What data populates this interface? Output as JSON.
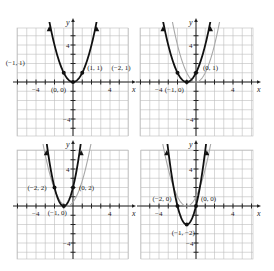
{
  "panels": [
    {
      "id": "top-left",
      "origin_px": [
        73,
        82
      ],
      "grid_px": {
        "x0": 17,
        "x1": 128,
        "y0": 28,
        "y1": 136
      },
      "curves": [
        {
          "role": "primary",
          "equation": "y = x^2",
          "vertex": [
            0,
            0
          ],
          "color": "#111111"
        }
      ],
      "points": [
        {
          "label": "(−1, 1)",
          "x": -1,
          "y": 1,
          "lx": -58,
          "ly": -8
        },
        {
          "label": "(1, 1)",
          "x": 1,
          "y": 1,
          "lx": 5,
          "ly": -3
        },
        {
          "label": "(0, 0)",
          "x": 0,
          "y": 0,
          "lx": -22,
          "ly": 10
        }
      ],
      "ticks_x": [
        "−4",
        "4"
      ],
      "ticks_y": [
        "4",
        "−4"
      ]
    },
    {
      "id": "top-right",
      "origin_px": [
        196,
        82
      ],
      "grid_px": {
        "x0": 140,
        "x1": 253,
        "y0": 28,
        "y1": 136
      },
      "curves": [
        {
          "role": "reference",
          "equation": "y = x^2",
          "vertex": [
            0,
            0
          ],
          "color": "#aaaaaa"
        },
        {
          "role": "primary",
          "equation": "y = (x+1)^2",
          "vertex": [
            -1,
            0
          ],
          "color": "#111111"
        }
      ],
      "points": [
        {
          "label": "(−2, 1)",
          "x": -2,
          "y": 1,
          "lx": -66,
          "ly": -3
        },
        {
          "label": "(0, 1)",
          "x": 0,
          "y": 1,
          "lx": 7,
          "ly": -3
        },
        {
          "label": "(−1, 0)",
          "x": -1,
          "y": 0,
          "lx": -22,
          "ly": 10
        }
      ],
      "ticks_x": [
        "−4",
        "4"
      ],
      "ticks_y": [
        "4",
        "−4"
      ]
    },
    {
      "id": "bottom-left",
      "origin_px": [
        73,
        206
      ],
      "grid_px": {
        "x0": 17,
        "x1": 128,
        "y0": 150,
        "y1": 259
      },
      "curves": [
        {
          "role": "reference",
          "equation": "y = (x+1)^2",
          "vertex": [
            -1,
            0
          ],
          "color": "#aaaaaa",
          "shift_x": 0.35
        },
        {
          "role": "primary",
          "equation": "y = 2(x+1)^2",
          "vertex": [
            -1,
            0
          ],
          "color": "#111111"
        }
      ],
      "points": [
        {
          "label": "(−2, 2)",
          "x": -2,
          "y": 2,
          "lx": -27,
          "ly": 2
        },
        {
          "label": "(0, 2)",
          "x": 0,
          "y": 2,
          "lx": 6,
          "ly": 2
        },
        {
          "label": "(−1, 0)",
          "x": -1,
          "y": 0,
          "lx": -16,
          "ly": 9
        }
      ],
      "ticks_x": [
        "−4",
        "4"
      ],
      "ticks_y": [
        "4",
        "−4"
      ]
    },
    {
      "id": "bottom-right",
      "origin_px": [
        196,
        206
      ],
      "grid_px": {
        "x0": 141,
        "x1": 253,
        "y0": 150,
        "y1": 259
      },
      "curves": [
        {
          "role": "reference",
          "equation": "y = (x+1)^2",
          "vertex": [
            -1,
            0
          ],
          "color": "#aaaaaa"
        },
        {
          "role": "primary",
          "equation": "y = 2(x+1)^2 − 2",
          "vertex": [
            -1,
            -2
          ],
          "color": "#111111"
        }
      ],
      "points": [
        {
          "label": "(−2, 0)",
          "x": -2,
          "y": 0,
          "lx": -25,
          "ly": -5
        },
        {
          "label": "(0, 0)",
          "x": 0,
          "y": 0,
          "lx": 5,
          "ly": -5
        },
        {
          "label": "(−1, −2)",
          "x": -1,
          "y": -2,
          "lx": -15,
          "ly": 10
        }
      ],
      "ticks_x": [
        "−4",
        "4"
      ],
      "ticks_y": [
        "4",
        "−4"
      ]
    }
  ],
  "axis_labels": {
    "x": "x",
    "y": "y"
  },
  "unit_px": 9.25,
  "colors": {
    "grid": "#bdbdbd",
    "axis": "#222222",
    "primary": "#111111",
    "reference": "#a8a8a8"
  }
}
